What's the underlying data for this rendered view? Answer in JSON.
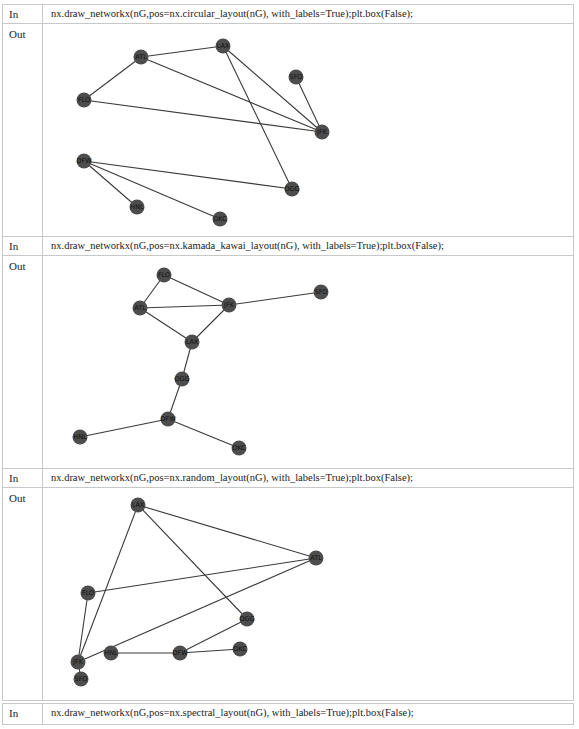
{
  "cells": [
    {
      "in_label": "In",
      "code": "nx.draw_networkx(nG,pos=nx.circular_layout(nG), with_labels=True);plt.box(False);",
      "out_label": "Out",
      "layout": "circular"
    },
    {
      "in_label": "In",
      "code": "nx.draw_networkx(nG,pos=nx.kamada_kawai_layout(nG), with_labels=True);plt.box(False);",
      "out_label": "Out",
      "layout": "kamada_kawai"
    },
    {
      "in_label": "In",
      "code": "nx.draw_networkx(nG,pos=nx.random_layout(nG), with_labels=True);plt.box(False);",
      "out_label": "Out",
      "layout": "random"
    },
    {
      "in_label": "In",
      "code": "nx.draw_networkx(nG,pos=nx.spectral_layout(nG), with_labels=True);plt.box(False);"
    }
  ],
  "graph": {
    "nodes": [
      "ATL",
      "LAX",
      "SFO",
      "FLO",
      "JFK",
      "DFW",
      "OGG",
      "HNL",
      "OKC"
    ],
    "edges": [
      [
        "ATL",
        "LAX"
      ],
      [
        "ATL",
        "FLO"
      ],
      [
        "ATL",
        "JFK"
      ],
      [
        "FLO",
        "JFK"
      ],
      [
        "LAX",
        "JFK"
      ],
      [
        "LAX",
        "OGG"
      ],
      [
        "SFO",
        "JFK"
      ],
      [
        "OGG",
        "DFW"
      ],
      [
        "DFW",
        "HNL"
      ],
      [
        "DFW",
        "OKC"
      ]
    ],
    "node_color": "#4d4d4d",
    "edge_color": "#3a3a3a"
  }
}
